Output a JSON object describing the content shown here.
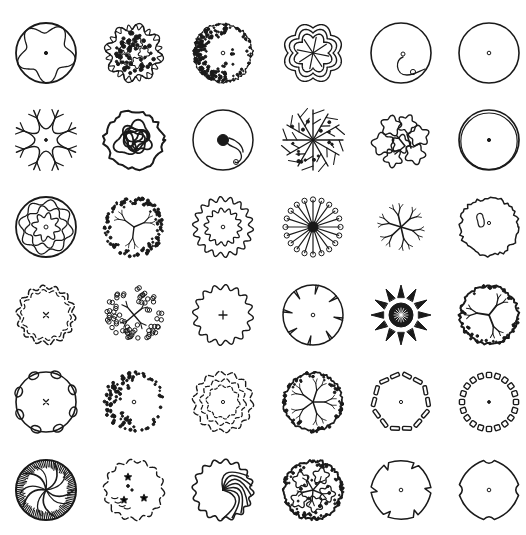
{
  "sheet": {
    "background": "#ffffff",
    "ink": "#1a1a1a",
    "columns_x": [
      46,
      134,
      223,
      313,
      401,
      489
    ],
    "rows_y": [
      53,
      140,
      227,
      315,
      402,
      490
    ],
    "radius": 30
  },
  "symbols": [
    {
      "row": 0,
      "col": 0,
      "type": "wavy-inner-circle",
      "name": "tree-symbol-wavy-inner"
    },
    {
      "row": 0,
      "col": 1,
      "type": "cloud-scallop-clustered",
      "name": "tree-symbol-flower-cluster"
    },
    {
      "row": 0,
      "col": 2,
      "type": "stipple-crescent",
      "name": "tree-symbol-stipple-crescent"
    },
    {
      "row": 0,
      "col": 3,
      "type": "maze-star",
      "name": "tree-symbol-maze-star"
    },
    {
      "row": 0,
      "col": 4,
      "type": "circle-lobe",
      "name": "tree-symbol-circle-lobe"
    },
    {
      "row": 0,
      "col": 5,
      "type": "plain-circle-dot",
      "name": "tree-symbol-plain-circle"
    },
    {
      "row": 1,
      "col": 0,
      "type": "arc-branches",
      "name": "tree-symbol-arc-branches"
    },
    {
      "row": 1,
      "col": 1,
      "type": "tangled-blobs",
      "name": "tree-symbol-tangled-blobs"
    },
    {
      "row": 1,
      "col": 2,
      "type": "circle-dark-core",
      "name": "tree-symbol-dark-core"
    },
    {
      "row": 1,
      "col": 3,
      "type": "radial-branches",
      "name": "tree-symbol-radial-branches"
    },
    {
      "row": 1,
      "col": 4,
      "type": "cloud-cluster",
      "name": "tree-symbol-cloud-cluster"
    },
    {
      "row": 1,
      "col": 5,
      "type": "double-circle-dot",
      "name": "tree-symbol-double-circle"
    },
    {
      "row": 2,
      "col": 0,
      "type": "concentric-wavy",
      "name": "tree-symbol-concentric-wavy"
    },
    {
      "row": 2,
      "col": 1,
      "type": "stipple-branches",
      "name": "tree-symbol-stipple-branches"
    },
    {
      "row": 2,
      "col": 2,
      "type": "double-gear",
      "name": "tree-symbol-double-gear"
    },
    {
      "row": 2,
      "col": 3,
      "type": "spokes-balls",
      "name": "tree-symbol-spokes-balls"
    },
    {
      "row": 2,
      "col": 4,
      "type": "bare-branches",
      "name": "tree-symbol-bare-branches"
    },
    {
      "row": 2,
      "col": 5,
      "type": "rough-outline",
      "name": "tree-symbol-rough-outline"
    },
    {
      "row": 3,
      "col": 0,
      "type": "dashed-scallop-x",
      "name": "tree-symbol-dashed-scallop"
    },
    {
      "row": 3,
      "col": 1,
      "type": "bubble-branches",
      "name": "tree-symbol-bubble-branches"
    },
    {
      "row": 3,
      "col": 2,
      "type": "gear-plus",
      "name": "tree-symbol-gear-plus"
    },
    {
      "row": 3,
      "col": 3,
      "type": "notched-circle",
      "name": "tree-symbol-notched-circle"
    },
    {
      "row": 3,
      "col": 4,
      "type": "star-burst",
      "name": "tree-symbol-star-burst"
    },
    {
      "row": 3,
      "col": 5,
      "type": "leafy-branches",
      "name": "tree-symbol-leafy-branches"
    },
    {
      "row": 4,
      "col": 0,
      "type": "circle-half-moons",
      "name": "tree-symbol-half-moons"
    },
    {
      "row": 4,
      "col": 1,
      "type": "dot-crescent",
      "name": "tree-symbol-dot-crescent"
    },
    {
      "row": 4,
      "col": 2,
      "type": "double-dashed-scallop",
      "name": "tree-symbol-double-dashed"
    },
    {
      "row": 4,
      "col": 3,
      "type": "stipple-leaf-branches",
      "name": "tree-symbol-stipple-leaves"
    },
    {
      "row": 4,
      "col": 4,
      "type": "dash-ring",
      "name": "tree-symbol-dash-ring"
    },
    {
      "row": 4,
      "col": 5,
      "type": "square-ring",
      "name": "tree-symbol-square-ring"
    },
    {
      "row": 5,
      "col": 0,
      "type": "hatched-swirl",
      "name": "tree-symbol-hatched-swirl"
    },
    {
      "row": 5,
      "col": 1,
      "type": "broken-scallop-stars",
      "name": "tree-symbol-broken-stars"
    },
    {
      "row": 5,
      "col": 2,
      "type": "scallop-swirl",
      "name": "tree-symbol-scallop-swirl"
    },
    {
      "row": 5,
      "col": 3,
      "type": "dense-leaves",
      "name": "tree-symbol-dense-leaves"
    },
    {
      "row": 5,
      "col": 4,
      "type": "hook-notch",
      "name": "tree-symbol-hook-notch"
    },
    {
      "row": 5,
      "col": 5,
      "type": "four-notch",
      "name": "tree-symbol-four-notch"
    }
  ]
}
